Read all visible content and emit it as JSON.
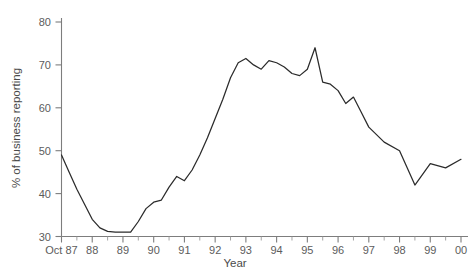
{
  "chart_data": {
    "type": "line",
    "title": "",
    "xlabel": "Year",
    "ylabel": "% of business reporting",
    "ylim": [
      30,
      80
    ],
    "yticks": [
      30,
      40,
      50,
      60,
      70,
      80
    ],
    "ytick_labels": [
      "30",
      "40",
      "50",
      "60",
      "70",
      "80"
    ],
    "xtick_labels": [
      "Oct 87",
      "88",
      "89",
      "90",
      "91",
      "92",
      "93",
      "94",
      "95",
      "96",
      "97",
      "98",
      "99",
      "00"
    ],
    "xlim": [
      0,
      13
    ],
    "grid": false,
    "legend": null,
    "series": [
      {
        "name": "% of business reporting",
        "color": "#2b2b2b",
        "x": [
          0.0,
          0.25,
          0.5,
          0.75,
          1.0,
          1.25,
          1.5,
          1.75,
          2.0,
          2.25,
          2.5,
          2.75,
          3.0,
          3.25,
          3.5,
          3.75,
          4.0,
          4.25,
          4.5,
          4.75,
          5.0,
          5.25,
          5.5,
          5.75,
          6.0,
          6.25,
          6.5,
          6.75,
          7.0,
          7.25,
          7.5,
          7.75,
          8.0,
          8.25,
          8.5,
          8.75,
          9.0,
          9.25,
          9.5,
          9.75,
          10.0,
          10.5,
          11.0,
          11.5,
          12.0,
          12.5,
          13.0
        ],
        "values": [
          49.0,
          45.0,
          41.0,
          37.5,
          34.0,
          32.0,
          31.2,
          31.0,
          31.0,
          31.0,
          33.5,
          36.5,
          38.0,
          38.5,
          41.5,
          44.0,
          43.0,
          45.5,
          49.0,
          53.0,
          57.5,
          62.0,
          67.0,
          70.5,
          71.5,
          70.0,
          69.0,
          71.0,
          70.5,
          69.5,
          68.0,
          67.5,
          69.0,
          74.0,
          66.0,
          65.5,
          64.0,
          61.0,
          62.5,
          59.0,
          55.5,
          52.0,
          50.0,
          42.0,
          47.0,
          46.0,
          48.0
        ]
      }
    ]
  },
  "chart": {
    "y_axis_label": "% of business reporting",
    "x_axis_label": "Year"
  }
}
